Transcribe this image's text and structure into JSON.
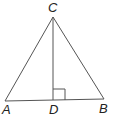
{
  "diagram": {
    "type": "triangle-with-altitude",
    "points": {
      "A": {
        "label": "A",
        "x": 5,
        "y": 101
      },
      "B": {
        "label": "B",
        "x": 104,
        "y": 99
      },
      "C": {
        "label": "C",
        "x": 53,
        "y": 17
      },
      "D": {
        "label": "D",
        "x": 53,
        "y": 100
      }
    },
    "segments": [
      "AC",
      "BC",
      "AB",
      "CD"
    ],
    "right_angle_marker": {
      "at": "D",
      "between": [
        "CD",
        "DB"
      ]
    },
    "labels": {
      "A": "A",
      "B": "B",
      "C": "C",
      "D": "D"
    },
    "colors": {
      "line": "#555555",
      "text": "#222222",
      "background": "#ffffff"
    }
  }
}
